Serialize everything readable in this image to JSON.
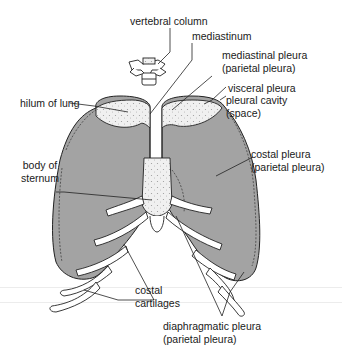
{
  "figure": {
    "colors": {
      "lung_fill": "#a3a3a3",
      "cut_surface": "#eeeeee",
      "bone_fill": "#ffffff",
      "outline": "#222222"
    },
    "labels": {
      "vertebral_column": "vertebral column",
      "mediastinum": "mediastinum",
      "mediastinal_pleura": [
        "mediastinal pleura",
        "(parietal pleura)"
      ],
      "hilum_of_lung": "hilum of lung",
      "visceral_pleura": "visceral pleura",
      "pleural_cavity": [
        "pleural cavity",
        "(space)"
      ],
      "body_of_sternum": [
        "body of",
        "sternum"
      ],
      "costal_pleura": [
        "costal pleura",
        "(parietal pleura)"
      ],
      "costal_cartilages": [
        "costal",
        "cartilages"
      ],
      "diaphragmatic_pleura": [
        "diaphragmatic pleura",
        "(parietal pleura)"
      ]
    }
  }
}
